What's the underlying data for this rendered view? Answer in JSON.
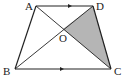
{
  "diagram": {
    "type": "trapezoid",
    "labels": {
      "A": "A",
      "B": "B",
      "C": "C",
      "D": "D",
      "O": "O"
    },
    "points": {
      "A": [
        36,
        6
      ],
      "D": [
        93,
        6
      ],
      "B": [
        15,
        69
      ],
      "C": [
        111,
        69
      ],
      "O": [
        63,
        29
      ]
    },
    "parallel_sides": [
      "AD",
      "BC"
    ],
    "diagonals": [
      "AC",
      "BD"
    ],
    "shaded_region": "OCD",
    "colors": {
      "stroke": "#222222",
      "shade": "#b5b5b5",
      "background": "#ffffff"
    }
  }
}
